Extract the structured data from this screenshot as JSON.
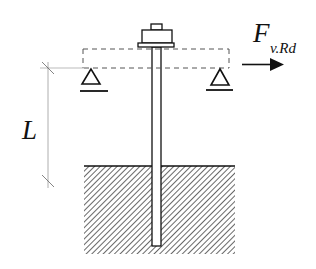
{
  "diagram": {
    "type": "structural-schematic",
    "labels": {
      "force_symbol": "F",
      "force_subscript": "v.Rd",
      "length_symbol": "L"
    },
    "elements": {
      "nut": {
        "cap": [
          151,
          24,
          11,
          6
        ],
        "body": [
          142,
          30,
          30,
          13
        ],
        "washer": [
          138,
          43,
          36,
          4
        ]
      },
      "rod": {
        "x": 152,
        "y": 47,
        "width": 9,
        "height": 199
      },
      "fixture_outline_dashed": {
        "top_y": 49,
        "bottom_y": 68,
        "left_x": 83,
        "right_x": 229
      },
      "supports": [
        {
          "name": "left-pin-support",
          "apex": [
            91,
            69
          ],
          "base_y": 84,
          "half_width": 9,
          "ground_y": 91,
          "ground_x": [
            80,
            108
          ]
        },
        {
          "name": "right-pin-support",
          "apex": [
            220,
            69
          ],
          "base_y": 85,
          "half_width": 9,
          "ground_y": 90,
          "ground_x": [
            206,
            233
          ]
        }
      ],
      "force_arrow": {
        "y": 64,
        "x_start": 242,
        "x_end": 284
      },
      "dimension_line": {
        "x": 48,
        "y_start": 63,
        "y_end": 185,
        "ticks_y": [
          68,
          180
        ]
      },
      "base_block": {
        "x": 84,
        "y": 166,
        "width": 151,
        "height": 88,
        "fill": "hatched"
      }
    },
    "colors": {
      "stroke": "#111111",
      "dashed": "#555555",
      "dimension": "#999999",
      "background": "#ffffff"
    }
  }
}
